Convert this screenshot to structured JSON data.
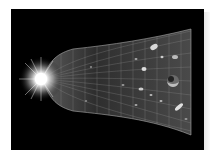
{
  "image": {
    "subject": "Illustration of the expansion of the universe from a bright Big Bang flash, shown as a widening grid-covered bell shape containing galaxies and a planet",
    "colors": {
      "background": "#ffffff",
      "space": "#000000",
      "flash": "#ffffff",
      "grid": "#9a9a9a",
      "cosmos_fill": "#3a3a3a"
    }
  }
}
